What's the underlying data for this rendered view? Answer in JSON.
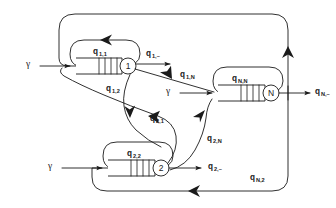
{
  "diagram": {
    "type": "queueing-network",
    "colors": {
      "stroke": "#1a1a1a",
      "background": "#ffffff"
    },
    "nodes": [
      {
        "id": "station-1",
        "server_label": "1",
        "queue_label_base": "q",
        "queue_label_sub": "1,1",
        "buffer_slots": 4
      },
      {
        "id": "station-2",
        "server_label": "2",
        "queue_label_base": "q",
        "queue_label_sub": "2,2",
        "buffer_slots": 4
      },
      {
        "id": "station-N",
        "server_label": "N",
        "queue_label_base": "q",
        "queue_label_sub": "N,N",
        "buffer_slots": 4
      }
    ],
    "arrivals": [
      {
        "id": "arrival-1",
        "label": "γ",
        "target": "station-1"
      },
      {
        "id": "arrival-2",
        "label": "γ",
        "target": "station-2"
      },
      {
        "id": "arrival-N",
        "label": "γ",
        "target": "station-N"
      }
    ],
    "departures": [
      {
        "id": "departure-1",
        "base": "q",
        "sub": "1,–",
        "source": "station-1"
      },
      {
        "id": "departure-2",
        "base": "q",
        "sub": "2,–",
        "source": "station-2"
      },
      {
        "id": "departure-N",
        "base": "q",
        "sub": "N,–",
        "source": "station-N"
      }
    ],
    "routes": [
      {
        "id": "route-1-1",
        "base": "q",
        "sub": "1,1",
        "from": "station-1",
        "to": "station-1"
      },
      {
        "id": "route-2-2",
        "base": "q",
        "sub": "2,2",
        "from": "station-2",
        "to": "station-2"
      },
      {
        "id": "route-N-N",
        "base": "q",
        "sub": "N,N",
        "from": "station-N",
        "to": "station-N"
      },
      {
        "id": "route-1-2",
        "base": "q",
        "sub": "1,2",
        "from": "station-1",
        "to": "station-2"
      },
      {
        "id": "route-2-1",
        "base": "q",
        "sub": "2,1",
        "from": "station-2",
        "to": "station-1"
      },
      {
        "id": "route-1-N",
        "base": "q",
        "sub": "1,N",
        "from": "station-1",
        "to": "station-N"
      },
      {
        "id": "route-2-N",
        "base": "q",
        "sub": "2,N",
        "from": "station-2",
        "to": "station-N"
      },
      {
        "id": "route-N-1",
        "base": "q",
        "sub": "N,1",
        "from": "station-N",
        "to": "station-1"
      },
      {
        "id": "route-N-2",
        "base": "q",
        "sub": "N,2",
        "from": "station-N",
        "to": "station-2"
      }
    ],
    "labels": {
      "gamma": "γ",
      "q_1_1_base": "q",
      "q_1_1_sub": "1,1",
      "q_2_2_base": "q",
      "q_2_2_sub": "2,2",
      "q_N_N_base": "q",
      "q_N_N_sub": "N,N",
      "q_1_dash_base": "q",
      "q_1_dash_sub": "1,–",
      "q_2_dash_base": "q",
      "q_2_dash_sub": "2,–",
      "q_N_dash_base": "q",
      "q_N_dash_sub": "N,–",
      "q_1_2_base": "q",
      "q_1_2_sub": "1,2",
      "q_2_1_base": "q",
      "q_2_1_sub": "2,1",
      "q_1_N_base": "q",
      "q_1_N_sub": "1,N",
      "q_2_N_base": "q",
      "q_2_N_sub": "2,N",
      "q_N_2_base": "q",
      "q_N_2_sub": "N,2",
      "node_1": "1",
      "node_2": "2",
      "node_N": "N"
    }
  }
}
